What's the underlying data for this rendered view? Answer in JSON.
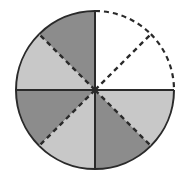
{
  "diagram": {
    "total_parts": 8,
    "shaded_parts": 6,
    "unshaded_parts": 2,
    "colors": {
      "dark": "#8c8c8c",
      "light": "#c8c8c8",
      "empty": "#ffffff",
      "stroke": "#2a2a2a"
    },
    "sectors": [
      {
        "index": 0,
        "start": 0,
        "end": 45,
        "fill": "empty"
      },
      {
        "index": 1,
        "start": 45,
        "end": 90,
        "fill": "empty"
      },
      {
        "index": 2,
        "start": 90,
        "end": 135,
        "fill": "light"
      },
      {
        "index": 3,
        "start": 135,
        "end": 180,
        "fill": "dark"
      },
      {
        "index": 4,
        "start": 180,
        "end": 225,
        "fill": "light"
      },
      {
        "index": 5,
        "start": 225,
        "end": 270,
        "fill": "dark"
      },
      {
        "index": 6,
        "start": 270,
        "end": 315,
        "fill": "light"
      },
      {
        "index": 7,
        "start": 315,
        "end": 360,
        "fill": "dark"
      }
    ]
  }
}
